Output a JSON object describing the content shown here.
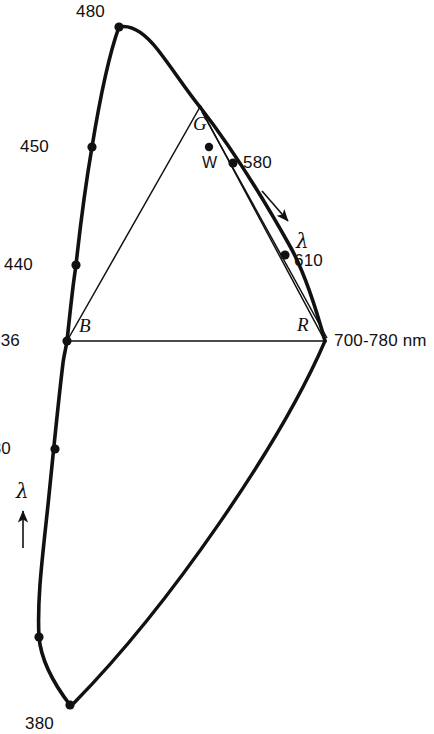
{
  "figure": {
    "background_color": "#ffffff",
    "ink_color": "#111111",
    "width": 434,
    "height": 734
  },
  "chart_data": {
    "type": "scatter",
    "xlabel": "",
    "ylabel": "",
    "grid": false,
    "legend_position": "none",
    "units": "nm",
    "axis_ranges": {
      "x_px": [
        0,
        434
      ],
      "y_px": [
        0,
        734
      ]
    },
    "spectral_locus_points": [
      {
        "label": "480",
        "wavelength": 480,
        "x": 119,
        "y": 27,
        "label_dx": -14,
        "label_dy": -24,
        "marker": true
      },
      {
        "label": "450",
        "wavelength": 450,
        "x": 92,
        "y": 147,
        "label_dx": -43,
        "label_dy": -9,
        "marker": true
      },
      {
        "label": "440",
        "wavelength": 440,
        "x": 76,
        "y": 265,
        "label_dx": -43,
        "label_dy": -9,
        "marker": true
      },
      {
        "label": "436",
        "wavelength": 436,
        "x": 67,
        "y": 341,
        "label_dx": -47,
        "label_dy": -9,
        "marker": true
      },
      {
        "label": "430",
        "wavelength": 430,
        "x": 55,
        "y": 449,
        "label_dx": -44,
        "label_dy": -9,
        "marker": true
      },
      {
        "label": "420",
        "wavelength": 420,
        "x": 39,
        "y": 637,
        "label_dx": -44,
        "label_dy": -9,
        "marker": true
      },
      {
        "label": "380",
        "wavelength": 380,
        "x": 70,
        "y": 705,
        "label_dx": -16,
        "label_dy": 10,
        "marker": true
      },
      {
        "label": "580",
        "wavelength": 580,
        "x": 233,
        "y": 163,
        "label_dx": 10,
        "label_dy": -9,
        "marker": true
      },
      {
        "label": "610",
        "wavelength": 610,
        "x": 285,
        "y": 255,
        "label_dx": 9,
        "label_dy": -3,
        "marker": true
      }
    ],
    "primaries": [
      {
        "name": "B",
        "label": "B",
        "x": 67,
        "y": 341,
        "label_dx": 12,
        "label_dy": -25
      },
      {
        "name": "G",
        "label": "G",
        "x": 200,
        "y": 107,
        "label_dx": -7,
        "label_dy": 7
      },
      {
        "name": "R",
        "label": "R",
        "x": 325,
        "y": 341,
        "label_dx": -28,
        "label_dy": -26
      }
    ],
    "white_point": {
      "name": "W",
      "label": "W",
      "x": 209,
      "y": 147,
      "label_dx": -7,
      "label_dy": 8
    },
    "long_wavelength_endpoint": {
      "label": "700-780 nm",
      "x": 325,
      "y": 341,
      "label_dx": 9,
      "label_dy": -9
    },
    "lambda_annotations": [
      {
        "label": "λ",
        "x": 296,
        "y": 231,
        "arrow_from": [
          262,
          191
        ],
        "arrow_to": [
          288,
          221
        ],
        "direction": "down-right"
      },
      {
        "label": "λ",
        "x": 16,
        "y": 481,
        "arrow_from": [
          23,
          548
        ],
        "arrow_to": [
          23,
          511
        ],
        "direction": "up"
      }
    ]
  },
  "geometry": {
    "spectral_locus_path": "M 70 705 C 54 684 41 661 39 637 C 37 600 42 561 48 505 C 53 456 58 404 63 363 C 64 355 66 348 67 341 C 68 332 70 312 73 287 C 74 279 75 272 76 265 C 80 228 85 188 92 147 C 99 104 107 60 119 27 C 133 24 147 36 158 50 C 172 68 187 91 200 107",
    "locus_tail_to_red_path": "M 200 107 C 228 143 262 196 291 248 C 304 272 317 312 325 341",
    "purple_line_path": "M 325 341 C 281 443 171 604 74 703",
    "triangle_path": "M 67 341 L 200 107 L 325 341 Z",
    "gr_inner_edge_path": "M 202 112 L 327 338",
    "locus_stroke_width": 3.6,
    "triangle_stroke_width": 1.5,
    "marker_radius": 4.6,
    "white_point_radius": 4.2
  },
  "margin_artifacts": {
    "visible": true,
    "fragments": [
      "",
      "",
      "",
      "",
      "",
      "",
      "",
      ""
    ]
  }
}
